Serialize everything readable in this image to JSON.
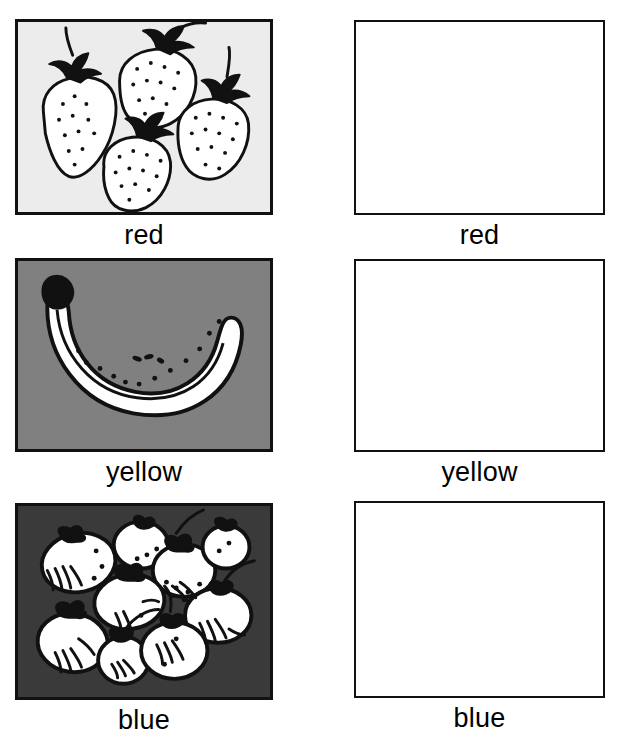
{
  "page": {
    "width": 624,
    "height": 740,
    "background": "#ffffff",
    "columns": 2,
    "rows": 3
  },
  "colors": {
    "ink": "#111111",
    "page_background": "#ffffff",
    "row1_panel_background": "#ececec",
    "row2_panel_background": "#808080",
    "row3_panel_background": "#3a3a3a",
    "fruit_fill": "#ffffff",
    "blank_panel_background": "#ffffff"
  },
  "rows": [
    {
      "id": "row-red",
      "label": "red",
      "picture": {
        "name": "strawberries-illustration",
        "subject": "strawberries",
        "count": 4,
        "background": "#ececec",
        "description": "Four line-drawn strawberries with stippled seeds and leafy green caps"
      },
      "answer_box": {
        "name": "answer-box-red",
        "label": "red",
        "filled": false
      }
    },
    {
      "id": "row-yellow",
      "label": "yellow",
      "picture": {
        "name": "banana-illustration",
        "subject": "banana",
        "count": 1,
        "background": "#808080",
        "description": "One curved line-drawn banana with dark stem and speckles"
      },
      "answer_box": {
        "name": "answer-box-yellow",
        "label": "yellow",
        "filled": false
      }
    },
    {
      "id": "row-blue",
      "label": "blue",
      "picture": {
        "name": "berries-illustration",
        "subject": "berries",
        "count": 9,
        "background": "#3a3a3a",
        "description": "Nine round line-drawn berries or plums with dark stems on a dark background"
      },
      "answer_box": {
        "name": "answer-box-blue",
        "label": "blue",
        "filled": false
      }
    }
  ]
}
